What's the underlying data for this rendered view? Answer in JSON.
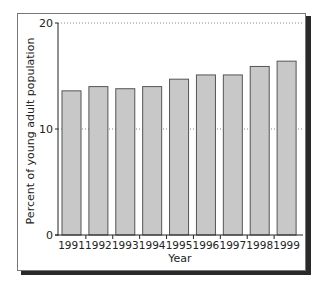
{
  "chart_data": {
    "type": "bar",
    "title": "",
    "xlabel": "Year",
    "ylabel": "Percent of young adult population",
    "categories": [
      "1991",
      "1992",
      "1993",
      "1994",
      "1995",
      "1996",
      "1997",
      "1998",
      "1999"
    ],
    "values": [
      13.6,
      14.0,
      13.8,
      14.0,
      14.7,
      15.1,
      15.1,
      15.9,
      16.4
    ],
    "ylim": [
      0,
      20
    ],
    "yticks": [
      "0",
      "10",
      "20"
    ],
    "grid": "dotted horizontal at 10 and 20",
    "legend": null,
    "bar_fill": "#c8c8c8",
    "bar_stroke": "#555555"
  }
}
